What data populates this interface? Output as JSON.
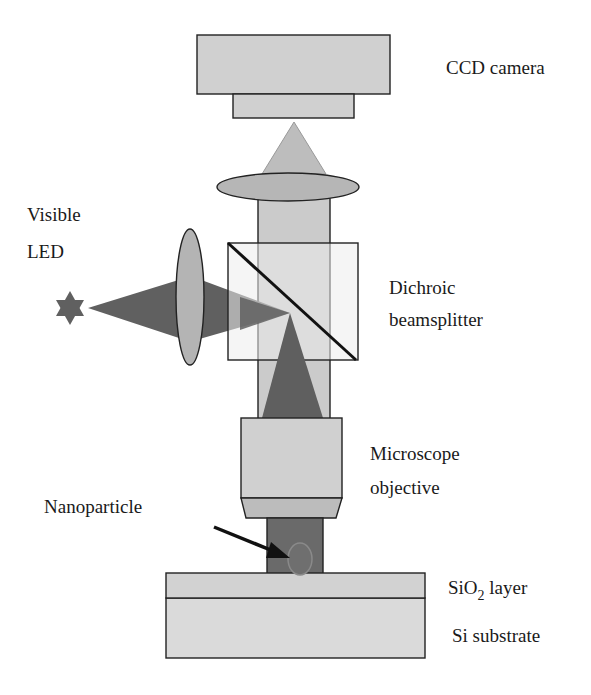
{
  "diagram": {
    "type": "optical-setup-schematic",
    "colors": {
      "light_gray": "#cfcfcf",
      "medium_gray": "#b4b4b4",
      "beam_dark": "#5f5f5f",
      "beamsplitter_fill": "#e6e6e6",
      "nanoparticle": "#6e6e6e",
      "outline": "#222222"
    },
    "labels": {
      "ccd_camera": "CCD camera",
      "led_line1": "Visible",
      "led_line2": "LED",
      "beamsplitter_line1": "Dichroic",
      "beamsplitter_line2": "beamsplitter",
      "objective_line1": "Microscope",
      "objective_line2": "objective",
      "nanoparticle": "Nanoparticle",
      "sio2_prefix": "SiO",
      "sio2_sub": "2",
      "sio2_suffix": " layer",
      "si_substrate": "Si substrate"
    },
    "components": [
      "CCD camera",
      "Tube lens",
      "Visible LED",
      "Condenser lens",
      "Dichroic beamsplitter",
      "Microscope objective",
      "Nanoparticle",
      "SiO2 layer",
      "Si substrate"
    ]
  }
}
